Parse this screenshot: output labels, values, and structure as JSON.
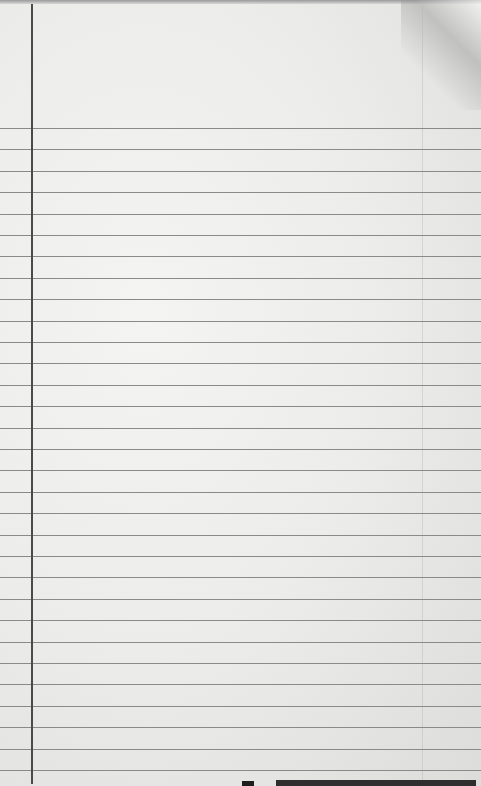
{
  "image": {
    "subject": "blank lined notebook paper",
    "paper_color": "#ececea",
    "rule_color": "#8a8a8a",
    "margin_line_color": "#4a4a4a",
    "first_rule_y": 128,
    "rule_spacing": 21.4,
    "rule_count": 31,
    "margin_line_x": 31
  }
}
